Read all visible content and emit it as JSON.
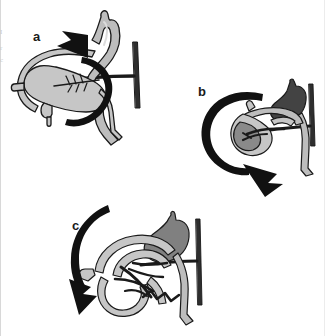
{
  "figure": {
    "kind": "medical-anatomical-illustration",
    "width": 325,
    "height": 336,
    "background_color": "#ffffff"
  },
  "margin_fragments": [
    {
      "text": "I",
      "x": 1,
      "y": 28
    },
    {
      "text": "r",
      "x": 1,
      "y": 44
    },
    {
      "text": "c",
      "x": 1,
      "y": 56
    }
  ],
  "palette": {
    "outline": "#1a1a1a",
    "arrow_black": "#111111",
    "bowel_light": "#bdbdbd",
    "bowel_light_fill": "#c6c6c6",
    "bowel_mid": "#8a8a8a",
    "bowel_dark": "#4a4a4a",
    "stomach_a": "#b8b8b8",
    "stomach_b": "#434343",
    "stomach_c": "#808080",
    "spine_bar": "#2e2e2e",
    "highlight": "#e4e4e4",
    "background": "#ffffff"
  },
  "panels": [
    {
      "id": "a",
      "label": "a",
      "label_x": 33,
      "label_y": 30,
      "caption_meaning": "Volvulus: midgut twisted clockwise around narrow mesenteric pedicle; arrow shows counter-clockwise derotation direction",
      "stomach_tone": "light",
      "rotation_arrow": {
        "style": "loop",
        "direction": "counter-clockwise",
        "head_points_to": "upper-left"
      },
      "features": [
        "stomach",
        "duodenum",
        "narrow-mesenteric-root",
        "mesenteric-vessel-branches",
        "small-bowel-mass",
        "cecum",
        "spine-bar",
        "transverse-band"
      ]
    },
    {
      "id": "b",
      "label": "b",
      "label_x": 198,
      "label_y": 85,
      "caption_meaning": "Partially untwisted midgut; arrow shows continued counter-clockwise rotation sweeping downward",
      "stomach_tone": "dark",
      "rotation_arrow": {
        "style": "loop",
        "direction": "counter-clockwise",
        "head_points_to": "lower-right"
      },
      "features": [
        "stomach",
        "duodenum",
        "partially-detorsed-loops",
        "mesenteric-root",
        "small-bowel-mass",
        "spine-bar",
        "transverse-band"
      ]
    },
    {
      "id": "c",
      "label": "c",
      "label_x": 72,
      "label_y": 219,
      "caption_meaning": "Fully reduced midgut with broadened mesenteric base; arrow shows final placement direction downward-left",
      "stomach_tone": "mid",
      "rotation_arrow": {
        "style": "sweep",
        "direction": "downward-left",
        "head_points_to": "down"
      },
      "features": [
        "stomach",
        "duodenum",
        "unwound-small-bowel",
        "broad-mesenteric-base",
        "colon",
        "spine-bar",
        "transverse-band"
      ]
    }
  ]
}
